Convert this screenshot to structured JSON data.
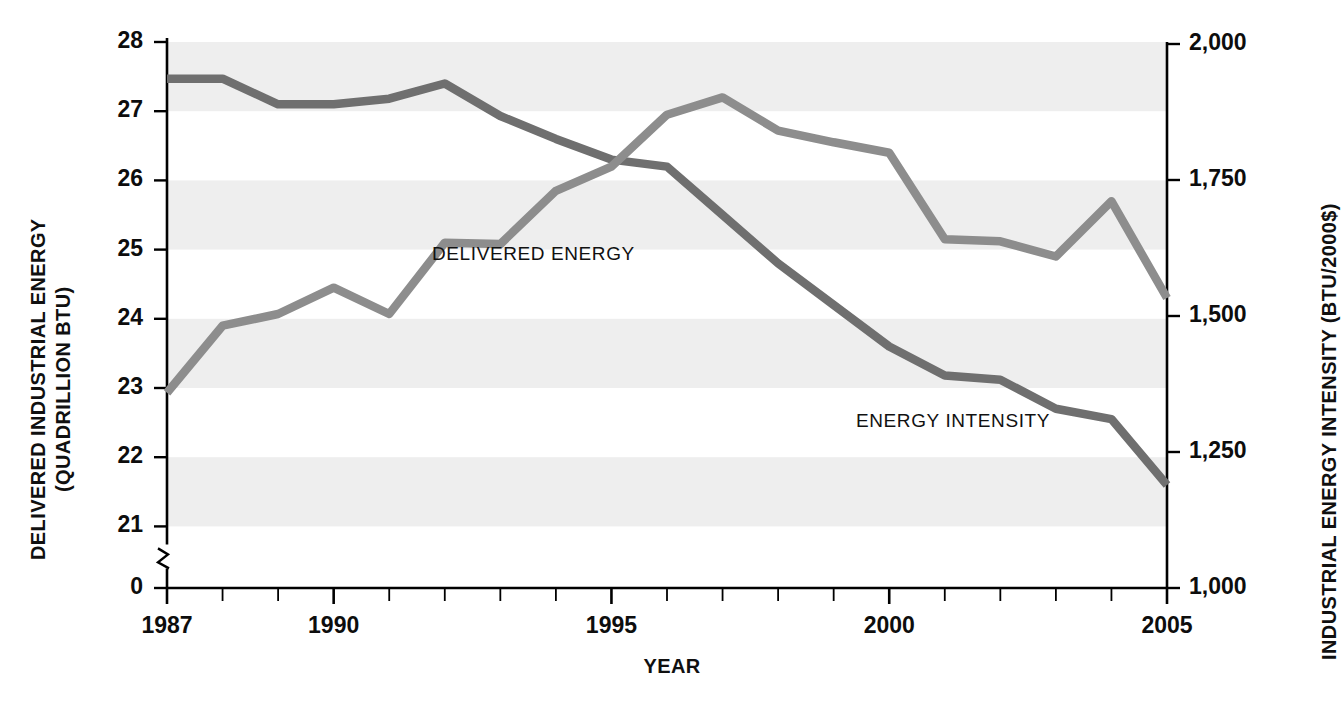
{
  "chart_data": {
    "type": "line",
    "title": "",
    "xlabel": "YEAR",
    "x": [
      1987,
      1988,
      1989,
      1990,
      1991,
      1992,
      1993,
      1994,
      1995,
      1996,
      1997,
      1998,
      1999,
      2000,
      2001,
      2002,
      2003,
      2004,
      2005
    ],
    "xtick_labels": [
      "1987",
      "1990",
      "1995",
      "2000",
      "2005"
    ],
    "xtick_values": [
      1987,
      1990,
      1995,
      2000,
      2005
    ],
    "xlim": [
      1987,
      2005
    ],
    "grid": "horizontal alternating gray bands",
    "legend": "inline series labels",
    "axes": [
      {
        "id": "left",
        "label_lines": [
          "DELIVERED INDUSTRIAL ENERGY",
          "(QUADRILLION BTU)"
        ],
        "ylabel": "DELIVERED INDUSTRIAL ENERGY (QUADRILLION BTU)",
        "tick_labels": [
          "28",
          "27",
          "26",
          "25",
          "24",
          "23",
          "22",
          "21",
          "0"
        ],
        "tick_values": [
          28,
          27,
          26,
          25,
          24,
          23,
          22,
          21,
          0
        ],
        "ylim": [
          21,
          28
        ],
        "axis_break": true
      },
      {
        "id": "right",
        "ylabel": "INDUSTRIAL ENERGY INTENSITY (BTU/2000$)",
        "tick_labels": [
          "2,000",
          "1,750",
          "1,500",
          "1,250",
          "1,000"
        ],
        "tick_values": [
          2000,
          1750,
          1500,
          1250,
          1000
        ],
        "ylim": [
          1000,
          2000
        ]
      }
    ],
    "series": [
      {
        "name": "DELIVERED ENERGY",
        "axis": "left",
        "units": "quadrillion BTU",
        "color": "#8d8d8d",
        "label_text": "DELIVERED ENERGY",
        "values": [
          22.93,
          23.9,
          24.07,
          24.45,
          24.07,
          25.1,
          25.08,
          25.85,
          26.2,
          26.95,
          27.2,
          26.72,
          26.55,
          26.4,
          25.15,
          25.12,
          24.9,
          25.7,
          24.3
        ]
      },
      {
        "name": "ENERGY INTENSITY",
        "axis": "right",
        "units": "BTU/2000$",
        "color": "#6f6f6f",
        "label_text": "ENERGY INTENSITY",
        "left_scale_values": [
          27.47,
          27.47,
          27.1,
          27.1,
          27.18,
          27.4,
          26.93,
          26.6,
          26.3,
          26.2,
          25.5,
          24.8,
          24.2,
          23.6,
          23.18,
          23.12,
          22.7,
          22.55,
          21.6
        ],
        "values": [
          1924,
          1924,
          1871,
          1871,
          1882,
          1914,
          1847,
          1800,
          1757,
          1743,
          1643,
          1543,
          1457,
          1371,
          1311,
          1303,
          1243,
          1221,
          1086
        ]
      }
    ],
    "band_color": "#eeeeee",
    "background": "#ffffff"
  },
  "labels": {
    "delivered_energy": "DELIVERED ENERGY",
    "energy_intensity": "ENERGY INTENSITY",
    "x_axis_title": "YEAR",
    "y_left_line1": "DELIVERED INDUSTRIAL ENERGY",
    "y_left_line2": "(QUADRILLION BTU)",
    "y_right_title": "INDUSTRIAL ENERGY INTENSITY (BTU/2000$)"
  },
  "ticks": {
    "left": [
      "28",
      "27",
      "26",
      "25",
      "24",
      "23",
      "22",
      "21",
      "0"
    ],
    "right": [
      "2,000",
      "1,750",
      "1,500",
      "1,250",
      "1,000"
    ],
    "bottom": [
      "1987",
      "1990",
      "1995",
      "2000",
      "2005"
    ]
  }
}
